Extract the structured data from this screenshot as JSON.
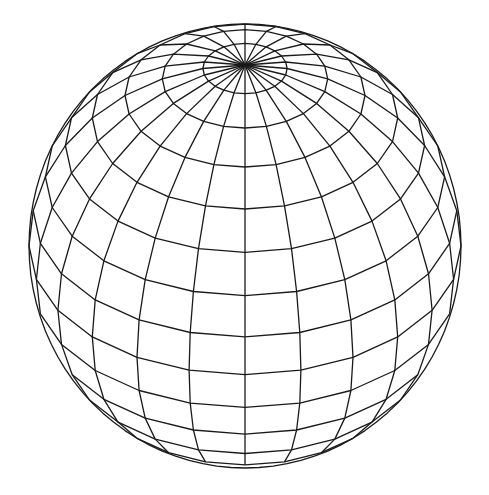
{
  "figure": {
    "type": "wireframe-sphere",
    "background": "#ffffff",
    "stroke": "#1a1a1a",
    "stroke_width": 1.3,
    "center": [
      245,
      246
    ],
    "radius_x": 216,
    "radius_y": 222,
    "tilt_deg": 35.4,
    "meridians": 24,
    "latitude_divisions": 16,
    "hidden_lines_removed": true
  }
}
